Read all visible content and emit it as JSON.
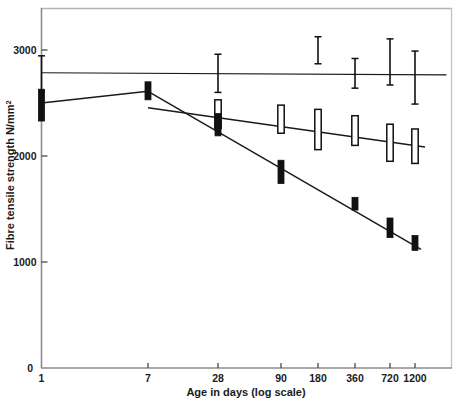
{
  "chart_data": {
    "type": "line",
    "title": "",
    "xlabel": "Age in days   (log scale)",
    "ylabel": "Fibre tensile strength N/mm",
    "ylabel_superscript": "2",
    "x_scale": "log",
    "categories": [
      "1",
      "7",
      "28",
      "90",
      "180",
      "360",
      "720",
      "1200"
    ],
    "x": [
      1,
      7,
      28,
      90,
      180,
      360,
      720,
      1200
    ],
    "xtick_labels": [
      "1",
      "7",
      "28",
      "90",
      "180",
      "360",
      "720",
      "1200"
    ],
    "ytick_labels": [
      "0",
      "1000",
      "2000",
      "3000"
    ],
    "yticks": [
      0,
      1000,
      2000,
      3000
    ],
    "ylim": [
      0,
      3390
    ],
    "grid": false,
    "legend": "none",
    "series": [
      {
        "name": "series-i-bar",
        "marker": "i-bar",
        "trend": "flat",
        "x": [
          1,
          28,
          180,
          360,
          720,
          1200
        ],
        "values": [
          2780,
          2780,
          3000,
          2780,
          2890,
          2740
        ],
        "err_low": [
          2610,
          2600,
          2870,
          2640,
          2670,
          2490
        ],
        "err_high": [
          2945,
          2960,
          3125,
          2920,
          3105,
          2990
        ],
        "line_from": 2785,
        "line_to": 2765
      },
      {
        "name": "series-open-bar",
        "marker": "open-rectangle",
        "trend": "declining",
        "x": [
          28,
          90,
          180,
          360,
          720,
          1200
        ],
        "values": [
          2410,
          2350,
          2250,
          2240,
          2130,
          2090
        ],
        "err_low": [
          2260,
          2215,
          2060,
          2100,
          1950,
          1930
        ],
        "err_high": [
          2530,
          2480,
          2440,
          2380,
          2300,
          2255
        ],
        "line_from": 2455,
        "line_to": 2085
      },
      {
        "name": "series-solid-bar",
        "marker": "solid-bar",
        "trend": "declining",
        "x": [
          1,
          7,
          28,
          90,
          360,
          720,
          1200
        ],
        "values": [
          2500,
          2610,
          2290,
          1840,
          1545,
          1320,
          1175
        ],
        "err_low": [
          2330,
          2530,
          2190,
          1740,
          1490,
          1230,
          1110
        ],
        "err_high": [
          2630,
          2700,
          2400,
          1960,
          1610,
          1415,
          1250
        ],
        "line_from": 2610,
        "line_to": 1120
      }
    ]
  },
  "axes": {
    "y_axis_label": "Fibre tensile strength N/mm",
    "y_axis_superscript": "2",
    "x_axis_label": "Age in days   (log scale)",
    "origin_label": "0"
  },
  "colors": {
    "frame": "#9a9a9a",
    "axis": "#4a4a4a",
    "marker_solid": "#111111",
    "marker_open_stroke": "#111111",
    "marker_open_fill": "#ffffff",
    "line": "#1a1a1a",
    "text": "#1a1a1a",
    "background": "#ffffff"
  }
}
